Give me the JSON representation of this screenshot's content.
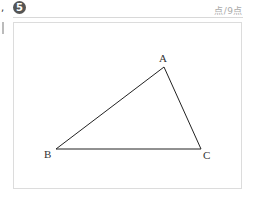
{
  "question": {
    "number": "5",
    "prefix_mark": ",",
    "score_text": "点/9点"
  },
  "figure": {
    "type": "triangle",
    "vertices": [
      {
        "label": "A",
        "x": 164,
        "y": 67
      },
      {
        "label": "B",
        "x": 56,
        "y": 149
      },
      {
        "label": "C",
        "x": 201,
        "y": 149
      }
    ],
    "colors": {
      "line": "#222222",
      "border": "#dcdcdc",
      "number_badge": "#555555"
    }
  }
}
